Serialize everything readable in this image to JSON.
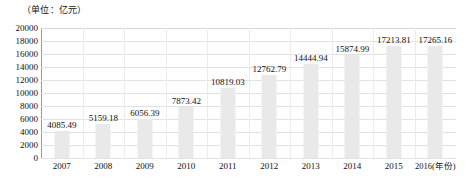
{
  "chart_data": {
    "type": "bar",
    "title": "",
    "subtitle": "",
    "unit_label": "（单位：亿元）",
    "xlabel": "年份",
    "ylabel": "",
    "categories": [
      "2007",
      "2008",
      "2009",
      "2010",
      "2011",
      "2012",
      "2013",
      "2014",
      "2015",
      "2016"
    ],
    "x_tick_labels": [
      "2007",
      "2008",
      "2009",
      "2010",
      "2011",
      "2012",
      "2013",
      "2014",
      "2015",
      "2016(年份)"
    ],
    "values": [
      4085.49,
      5159.18,
      6056.39,
      7873.42,
      10819.03,
      12762.79,
      14444.94,
      15874.99,
      17213.81,
      17265.16
    ],
    "value_labels": [
      "4085.49",
      "5159.18",
      "6056.39",
      "7873.42",
      "10819.03",
      "12762.79",
      "14444.94",
      "15874.99",
      "17213.81",
      "17265.16"
    ],
    "ylim": [
      0,
      20000
    ],
    "y_tick_values": [
      0,
      2000,
      4000,
      6000,
      8000,
      10000,
      12000,
      14000,
      16000,
      18000,
      20000
    ],
    "y_tick_labels": [
      "0",
      "2000",
      "4000",
      "6000",
      "8000",
      "10000",
      "12000",
      "14000",
      "16000",
      "18000",
      "20000"
    ],
    "grid": "horizontal-and-vertical",
    "legend": "none",
    "legend_position": "",
    "colors": {
      "bar_fill": "#e9e9e9",
      "gridline": "#e2e2e2",
      "axis_line": "#9a9a9a",
      "text": "#111111",
      "background": "#ffffff"
    }
  }
}
